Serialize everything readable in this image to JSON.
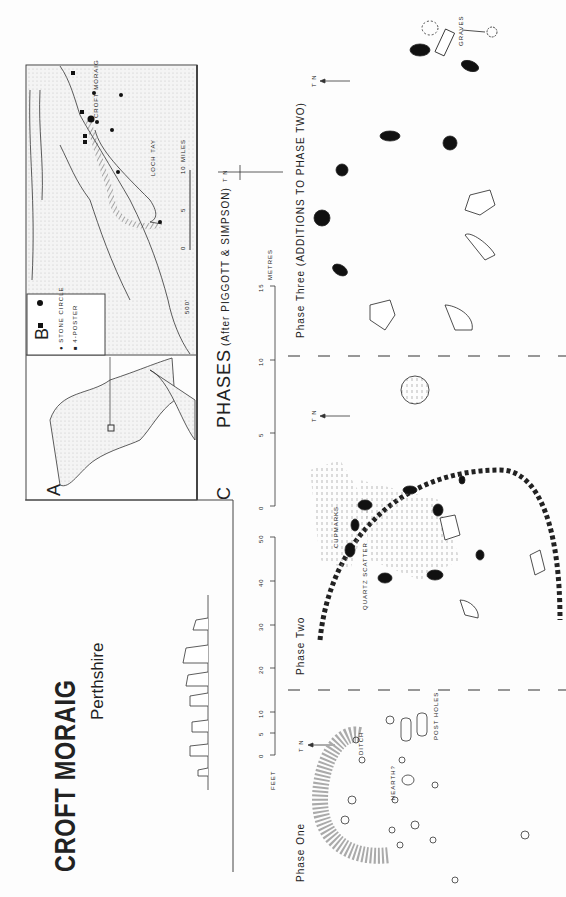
{
  "title": "CROFT MORAIG",
  "subtitle": "Perthshire",
  "panels": {
    "a": {
      "label": "A"
    },
    "b": {
      "label": "B",
      "legend": [
        {
          "symbol": "circle",
          "label": "STONE CIRCLE"
        },
        {
          "symbol": "square",
          "label": "4-POSTER"
        }
      ],
      "place_labels": [
        "CROFT MORAIG",
        "LOCH TAY"
      ],
      "contour_label": "500'",
      "scale": {
        "ticks": [
          "0",
          "5",
          "10"
        ],
        "unit": "MILES"
      }
    },
    "c": {
      "label": "C",
      "heading": "PHASES",
      "credit": "(After PIGGOTT & SIMPSON)"
    }
  },
  "scales": {
    "metres": {
      "unit": "METRES",
      "ticks": [
        "0",
        "5",
        "10",
        "15"
      ]
    },
    "feet": {
      "unit": "FEET",
      "ticks": [
        "0",
        "5",
        "10",
        "20",
        "30",
        "40",
        "50"
      ]
    }
  },
  "north_label": "T N",
  "phases": [
    {
      "name": "Phase One",
      "annotations": [
        "DITCH",
        "HEARTH?",
        "POST HOLES"
      ]
    },
    {
      "name": "Phase Two",
      "annotations": [
        "CUPMARKS",
        "QUARTZ SCATTER"
      ]
    },
    {
      "name": "Phase Three (ADDITIONS TO PHASE TWO)",
      "annotations": [
        "GRAVES"
      ]
    }
  ]
}
